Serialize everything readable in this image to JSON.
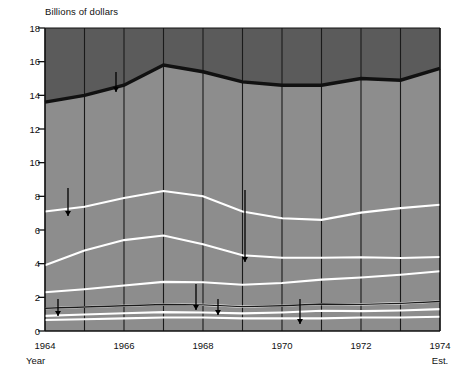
{
  "chart_data": {
    "type": "area",
    "title": "",
    "ylabel": "Billions of dollars",
    "xlabel": "Year",
    "ylim": [
      0,
      18
    ],
    "xlim": [
      1964,
      1974
    ],
    "grid": true,
    "legend_position": "inline-annotations",
    "y_ticks": [
      0,
      2,
      4,
      6,
      8,
      10,
      12,
      14,
      16,
      18
    ],
    "x_ticks": [
      1964,
      1965,
      1966,
      1967,
      1968,
      1969,
      1970,
      1971,
      1972,
      1973,
      1974
    ],
    "x_tick_labels": [
      "1964",
      "",
      "1966",
      "",
      "1968",
      "",
      "1970",
      "",
      "1972",
      "",
      "1974"
    ],
    "x_last_sublabel": "Est.",
    "x": [
      1964,
      1965,
      1966,
      1967,
      1968,
      1969,
      1970,
      1971,
      1972,
      1973,
      1974
    ],
    "stacked": true,
    "series": [
      {
        "name": "Other",
        "label": "Other",
        "values": [
          0.65,
          0.7,
          0.75,
          0.8,
          0.8,
          0.75,
          0.75,
          0.75,
          0.8,
          0.8,
          0.85
        ]
      },
      {
        "name": "National Science Foundation",
        "label": "National Science Foundation",
        "values": [
          0.25,
          0.28,
          0.3,
          0.32,
          0.3,
          0.3,
          0.35,
          0.45,
          0.38,
          0.42,
          0.45
        ]
      },
      {
        "name": "Atomic Energy Commission",
        "label": "Atomic Energy Commission",
        "values": [
          0.45,
          0.45,
          0.45,
          0.45,
          0.45,
          0.4,
          0.4,
          0.4,
          0.4,
          0.42,
          0.45
        ]
      },
      {
        "name": "Department of Health, Education, and Welfare",
        "label": "Department of Health, Education, and Welfare",
        "values": [
          0.95,
          1.05,
          1.2,
          1.35,
          1.35,
          1.3,
          1.35,
          1.45,
          1.6,
          1.7,
          1.8
        ]
      },
      {
        "name": "National Aeronautics and Space Administration",
        "label": "National Aeronautics and Space Administration",
        "values": [
          1.6,
          2.3,
          2.7,
          2.75,
          2.25,
          1.75,
          1.5,
          1.3,
          1.2,
          1.0,
          0.85
        ]
      },
      {
        "name": "Department of Defense",
        "label": "Department of Defense",
        "values": [
          3.2,
          2.6,
          2.5,
          2.65,
          2.85,
          2.6,
          2.35,
          2.25,
          2.65,
          2.96,
          3.1
        ]
      },
      {
        "name": "Total",
        "label": "Total",
        "values": [
          13.6,
          14.0,
          14.6,
          15.8,
          15.4,
          14.8,
          14.6,
          14.6,
          15.0,
          14.9,
          15.6
        ],
        "is_total_line": true
      }
    ],
    "boundaries": {
      "other_top": [
        0.65,
        0.7,
        0.75,
        0.8,
        0.8,
        0.75,
        0.75,
        0.75,
        0.8,
        0.8,
        0.85
      ],
      "nsf_top": [
        0.9,
        0.98,
        1.05,
        1.12,
        1.1,
        1.05,
        1.1,
        1.2,
        1.18,
        1.22,
        1.3
      ],
      "aec_top": [
        1.35,
        1.43,
        1.5,
        1.57,
        1.55,
        1.45,
        1.5,
        1.6,
        1.58,
        1.64,
        1.75
      ],
      "hew_top": [
        2.3,
        2.48,
        2.7,
        2.92,
        2.9,
        2.75,
        2.85,
        3.05,
        3.18,
        3.34,
        3.55
      ],
      "nasa_top": [
        3.9,
        4.78,
        5.4,
        5.67,
        5.15,
        4.5,
        4.35,
        4.35,
        4.38,
        4.34,
        4.4
      ],
      "dod_top": [
        7.1,
        7.38,
        7.9,
        8.32,
        8.0,
        7.1,
        6.7,
        6.6,
        7.03,
        7.3,
        7.5
      ]
    },
    "colors": {
      "upper_fill": "#5b5b5b",
      "lower_fill": "#8d8d8d",
      "total_line": "#111111",
      "band_line": "#ffffff",
      "grid_line": "#1a1a1a",
      "axis": "#111111",
      "text": "#111111"
    },
    "annotations": [
      {
        "text": "Total",
        "target": "Total"
      },
      {
        "text": "Department of Defense",
        "target": "Department of Defense"
      },
      {
        "text": "National Aeronautics and Space Administration",
        "target": "National Aeronautics and Space Administration"
      },
      {
        "text": "Department of Health, Education, and Welfare",
        "target": "Department of Health, Education, and Welfare"
      },
      {
        "text": "Atomic Energy Commission",
        "target": "Atomic Energy Commission"
      },
      {
        "text": "Other",
        "target": "Other"
      },
      {
        "text": "National Science Foundation",
        "target": "National Science Foundation"
      }
    ]
  },
  "labels": {
    "y_axis_title": "Billions of dollars",
    "x_axis_title": "Year",
    "est_note": "Est.",
    "total": "Total",
    "dod": "Department of Defense",
    "nasa": "National Aeronautics and Space Administration",
    "hew": "Department of Health, Education, and Welfare",
    "aec": "Atomic Energy Commission",
    "other": "Other",
    "nsf": "National Science Foundation",
    "y0": "0",
    "y2": "2",
    "y4": "4",
    "y6": "6",
    "y8": "8",
    "y10": "10",
    "y12": "12",
    "y14": "14",
    "y16": "16",
    "y18": "18",
    "x1964": "1964",
    "x1966": "1966",
    "x1968": "1968",
    "x1970": "1970",
    "x1972": "1972",
    "x1974": "1974"
  }
}
